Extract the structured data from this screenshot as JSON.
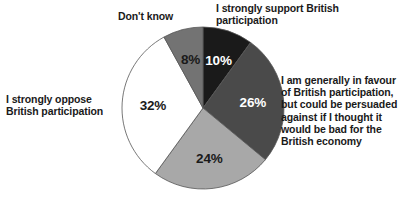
{
  "chart_data": {
    "type": "pie",
    "title": "",
    "legend_position": "callout-labels",
    "total": 100,
    "units": "%",
    "categories": [
      "I strongly support British participation",
      "I am generally in favour of British participation, but could be persuaded against if I thought it would be bad for the British economy",
      "",
      "I strongly oppose British participation",
      "Don't know"
    ],
    "values": [
      10,
      26,
      24,
      32,
      8
    ],
    "slices": [
      {
        "label": "I strongly support British participation",
        "value": 10,
        "value_text": "10%",
        "color": "#1a1a1a",
        "text_color": "#ffffff"
      },
      {
        "label": "I am generally in favour of British participation, but could be persuaded against if I thought it would be bad for the British economy",
        "value": 26,
        "value_text": "26%",
        "color": "#4a4a4a",
        "text_color": "#ffffff"
      },
      {
        "label": "",
        "value": 24,
        "value_text": "24%",
        "color": "#a8a8a8",
        "text_color": "#1a1a1a"
      },
      {
        "label": "I strongly oppose British participation",
        "value": 32,
        "value_text": "32%",
        "color": "#ffffff",
        "text_color": "#1a1a1a"
      },
      {
        "label": "Don't know",
        "value": 8,
        "value_text": "8%",
        "color": "#737373",
        "text_color": "#1a1a1a"
      }
    ]
  },
  "labels": {
    "dont_know": "Don't know",
    "strongly_support": "I strongly support British\nparticipation",
    "generally_favour": "I am generally in favour\nof British participation,\nbut could be persuaded\nagainst if I thought it\nwould be bad for the\nBritish economy",
    "strongly_oppose": "I strongly oppose\nBritish participation"
  },
  "values_text": {
    "support": "10%",
    "favour": "26%",
    "unlabeled": "24%",
    "oppose": "32%",
    "dont_know": "8%"
  },
  "colors": {
    "support": "#1a1a1a",
    "favour": "#4a4a4a",
    "unlabeled": "#a8a8a8",
    "oppose": "#ffffff",
    "dont_know": "#737373",
    "outline": "#555555",
    "background": "#ffffff",
    "text": "#1a1a1a"
  }
}
